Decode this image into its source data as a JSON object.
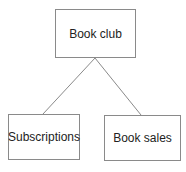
{
  "diagram": {
    "type": "tree",
    "root": {
      "label": "Book club"
    },
    "children": [
      {
        "label": "Subscriptions"
      },
      {
        "label": "Book sales"
      }
    ],
    "colors": {
      "border": "#8a8a8a",
      "line": "#8a8a8a",
      "text": "#222222",
      "background": "#ffffff"
    }
  }
}
